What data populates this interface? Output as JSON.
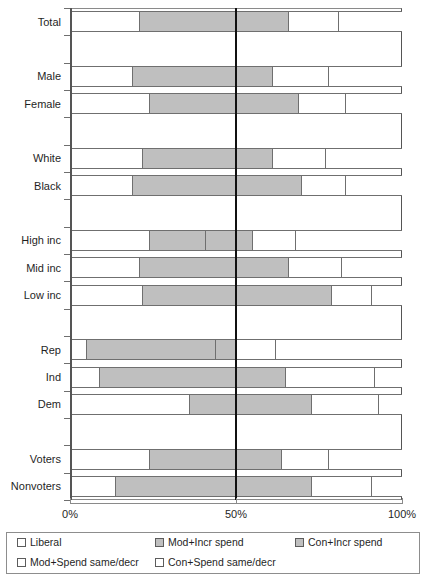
{
  "chart_data": {
    "type": "bar",
    "subtype": "stacked-horizontal-diverging",
    "title": "",
    "xlabel": "",
    "ylabel": "",
    "xlim": [
      0,
      100
    ],
    "xticks": [
      0,
      50,
      100
    ],
    "xticklabels": [
      "0%",
      "50%",
      "100%"
    ],
    "grid": false,
    "legend_position": "bottom",
    "reference_line": 50,
    "series": [
      {
        "name": "Liberal",
        "color": "#ffffff",
        "swatch": "light"
      },
      {
        "name": "Mod+Incr spend",
        "color": "#bfbfbf",
        "swatch": "gray"
      },
      {
        "name": "Con+Incr spend",
        "color": "#bfbfbf",
        "swatch": "gray"
      },
      {
        "name": "Mod+Spend same/decr",
        "color": "#ffffff",
        "swatch": "light"
      },
      {
        "name": "Con+Spend same/decr",
        "color": "#ffffff",
        "swatch": "light"
      }
    ],
    "categories": [
      "Total",
      "",
      "Male",
      "Female",
      "",
      "White",
      "Black",
      "",
      "High inc",
      "Mid inc",
      "Low inc",
      "",
      "Rep",
      "Ind",
      "Dem",
      "",
      "Voters",
      "Nonvoters"
    ],
    "rows": [
      {
        "label": "Total",
        "blank": false,
        "values": [
          21,
          29,
          16,
          15,
          19
        ]
      },
      {
        "label": "",
        "blank": true,
        "values": []
      },
      {
        "label": "Male",
        "blank": false,
        "values": [
          19,
          31,
          11,
          17,
          22
        ]
      },
      {
        "label": "Female",
        "blank": false,
        "values": [
          24,
          26,
          19,
          14,
          17
        ]
      },
      {
        "label": "",
        "blank": true,
        "values": []
      },
      {
        "label": "White",
        "blank": false,
        "values": [
          22,
          28,
          11,
          16,
          23
        ]
      },
      {
        "label": "Black",
        "blank": false,
        "values": [
          19,
          31,
          20,
          13,
          17
        ]
      },
      {
        "label": "",
        "blank": true,
        "values": []
      },
      {
        "label": "High inc",
        "blank": false,
        "values": [
          24,
          17,
          14,
          13,
          32
        ]
      },
      {
        "label": "Mid inc",
        "blank": false,
        "values": [
          21,
          29,
          16,
          16,
          18
        ]
      },
      {
        "label": "Low inc",
        "blank": false,
        "values": [
          22,
          28,
          29,
          12,
          9
        ]
      },
      {
        "label": "",
        "blank": true,
        "values": []
      },
      {
        "label": "Rep",
        "blank": false,
        "values": [
          5,
          39,
          6,
          12,
          38
        ]
      },
      {
        "label": "Ind",
        "blank": false,
        "values": [
          9,
          41,
          15,
          27,
          8
        ]
      },
      {
        "label": "Dem",
        "blank": false,
        "values": [
          36,
          14,
          23,
          20,
          7
        ]
      },
      {
        "label": "",
        "blank": true,
        "values": []
      },
      {
        "label": "Voters",
        "blank": false,
        "values": [
          24,
          26,
          14,
          14,
          22
        ]
      },
      {
        "label": "Nonvoters",
        "blank": false,
        "values": [
          14,
          36,
          23,
          18,
          9
        ]
      }
    ]
  },
  "axis": {
    "x_tick_labels": [
      "0%",
      "50%",
      "100%"
    ]
  },
  "legend": {
    "items": [
      {
        "label": "Liberal",
        "swatch": "light"
      },
      {
        "label": "Mod+Incr spend",
        "swatch": "gray"
      },
      {
        "label": "Con+Incr spend",
        "swatch": "gray"
      },
      {
        "label": "Mod+Spend same/decr",
        "swatch": "light"
      },
      {
        "label": "Con+Spend same/decr",
        "swatch": "light"
      }
    ]
  }
}
